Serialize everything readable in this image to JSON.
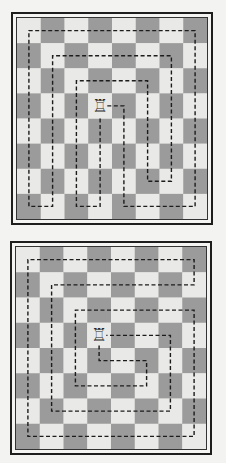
{
  "colors": {
    "light_square": "#e9e9e7",
    "dark_square": "#9b9b9b",
    "path": "#1c1c1c",
    "rook": "#2a2a2a"
  },
  "boards": [
    {
      "id": "top",
      "size": 8,
      "top_left_square": "light",
      "piece": {
        "type": "rook",
        "icon": "rook-icon",
        "glyph": "♖",
        "col": 3,
        "row": 3
      },
      "tour_path": [
        [
          3.8,
          3.5
        ],
        [
          4.5,
          3.5
        ],
        [
          4.5,
          7.5
        ],
        [
          7.5,
          7.5
        ],
        [
          7.5,
          0.5
        ],
        [
          0.5,
          0.5
        ],
        [
          0.5,
          7.5
        ],
        [
          1.5,
          7.5
        ],
        [
          1.5,
          1.5
        ],
        [
          6.5,
          1.5
        ],
        [
          6.5,
          6.5
        ],
        [
          5.5,
          6.5
        ],
        [
          5.5,
          2.5
        ],
        [
          2.5,
          2.5
        ],
        [
          2.5,
          7.5
        ],
        [
          3.5,
          7.5
        ],
        [
          3.5,
          3.9
        ]
      ]
    },
    {
      "id": "bottom",
      "size": 8,
      "top_left_square": "light",
      "piece": {
        "type": "rook",
        "icon": "rook-icon",
        "glyph": "♖",
        "col": 3,
        "row": 3
      },
      "tour_path": [
        [
          3.5,
          3.9
        ],
        [
          3.5,
          4.5
        ],
        [
          5.5,
          4.5
        ],
        [
          5.5,
          5.5
        ],
        [
          2.5,
          5.5
        ],
        [
          2.5,
          2.5
        ],
        [
          7.5,
          2.5
        ],
        [
          7.5,
          7.5
        ],
        [
          0.5,
          7.5
        ],
        [
          0.5,
          0.5
        ],
        [
          7.5,
          0.5
        ],
        [
          7.5,
          1.5
        ],
        [
          1.5,
          1.5
        ],
        [
          1.5,
          6.5
        ],
        [
          6.5,
          6.5
        ],
        [
          6.5,
          3.5
        ],
        [
          3.8,
          3.5
        ]
      ]
    }
  ]
}
